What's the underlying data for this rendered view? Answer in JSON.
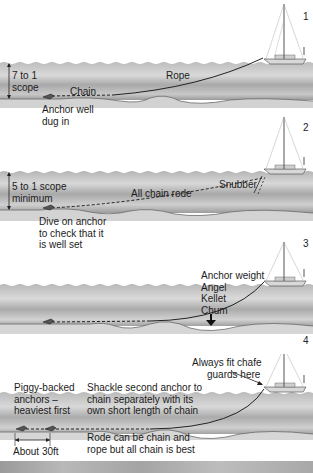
{
  "diagram": {
    "colors": {
      "water_dark": "#9e9e9e",
      "water_light": "#e4e4e4",
      "seabed": "#d6d6d6",
      "line": "#222222",
      "background": "#ffffff"
    },
    "panels": [
      {
        "number": "1",
        "scope_label": [
          "7 to 1",
          "scope"
        ],
        "labels": {
          "chain": "Chain",
          "rope": "Rope",
          "anchor_note": [
            "Anchor well",
            "dug in"
          ]
        }
      },
      {
        "number": "2",
        "scope_label": [
          "5 to 1 scope",
          "minimum"
        ],
        "labels": {
          "rode": "All chain rode",
          "snubber": "Snubber",
          "dive_note": [
            "Dive on anchor",
            "to check that it",
            "is well set"
          ]
        }
      },
      {
        "number": "3",
        "labels": {
          "weight_names": [
            "Anchor weight",
            "Angel",
            "Kellet",
            "Chum"
          ]
        }
      },
      {
        "number": "4",
        "labels": {
          "chafe_note": [
            "Always fit chafe",
            "guards here"
          ],
          "piggy_note": [
            "Piggy-backed",
            "anchors –",
            "heaviest first"
          ],
          "shackle_note": [
            "Shackle second anchor to",
            "chain separately with its",
            "own short length of chain"
          ],
          "rode_note": [
            "Rode can be chain and",
            "rope but all chain is best"
          ],
          "distance": "About 30ft"
        }
      }
    ]
  }
}
